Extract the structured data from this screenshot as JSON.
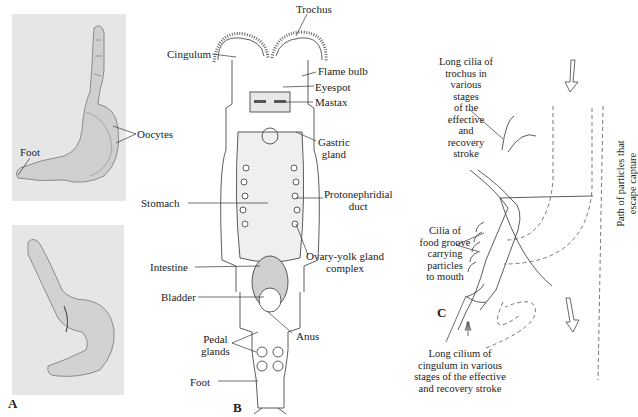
{
  "figure": {
    "panels": [
      {
        "letter": "A",
        "description": "Photomicrographs of rotifer",
        "labels": [
          "Foot",
          "Oocytes"
        ]
      },
      {
        "letter": "B",
        "description": "Rotifer anatomy diagram",
        "labels": {
          "trochus": "Trochus",
          "cingulum": "Cingulum",
          "flame_bulb": "Flame bulb",
          "eyespot": "Eyespot",
          "mastax": "Mastax",
          "gastric_gland_1": "Gastric",
          "gastric_gland_2": "gland",
          "protonephridial_1": "Protonephridial",
          "protonephridial_2": "duct",
          "stomach": "Stomach",
          "ovary_1": "Ovary-yolk gland",
          "ovary_2": "complex",
          "intestine": "Intestine",
          "bladder": "Bladder",
          "anus": "Anus",
          "pedal_1": "Pedal",
          "pedal_2": "glands",
          "foot": "Foot"
        }
      },
      {
        "letter": "C",
        "description": "Ciliary feeding currents",
        "labels": {
          "long_cilia": [
            "Long cilia of",
            "trochus in",
            "various",
            "stages",
            "of the",
            "effective",
            "and",
            "recovery",
            "stroke"
          ],
          "food_groove": [
            "Cilia of",
            "food groove",
            "carrying",
            "particles",
            "to mouth"
          ],
          "escape": [
            "Path of particles that",
            "escape capture"
          ],
          "cingulum_cilium": [
            "Long cilium of",
            "cingulum in various",
            "stages of the effective",
            "and recovery stroke"
          ]
        }
      }
    ],
    "panel_a": {
      "foot": "Foot",
      "oocytes": "Oocytes",
      "letter": "A"
    },
    "panel_b_letter": "B",
    "panel_c_letter": "C"
  }
}
